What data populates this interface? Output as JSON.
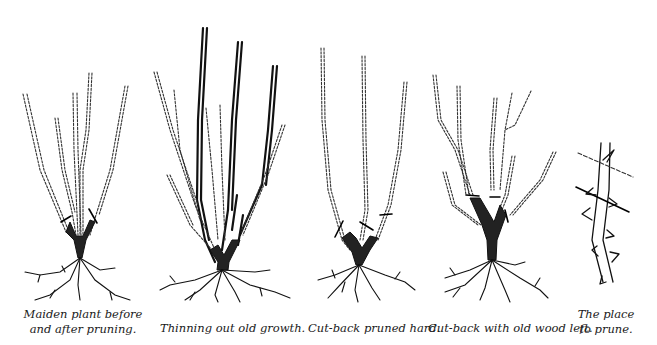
{
  "figure": {
    "panels": [
      {
        "id": "maiden",
        "caption_lines": [
          "Maiden plant before",
          "and after pruning."
        ]
      },
      {
        "id": "thinning",
        "caption_lines": [
          "Thinning out old growth."
        ]
      },
      {
        "id": "cutback-hard",
        "caption_lines": [
          "Cut-back pruned hard."
        ]
      },
      {
        "id": "cutback-oldwood",
        "caption_lines": [
          "Cut-back with old wood left."
        ]
      },
      {
        "id": "place-to-prune",
        "caption_lines": [
          "The place",
          "to prune."
        ]
      }
    ],
    "colors": {
      "ink": "#111111",
      "background": "#ffffff"
    }
  }
}
